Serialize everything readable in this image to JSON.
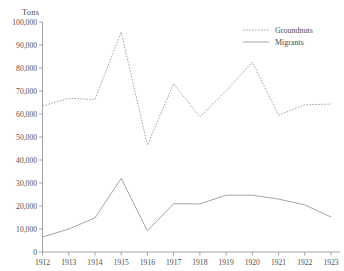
{
  "figure": {
    "cropped_title": "................",
    "y_axis_unit_label": "Tons"
  },
  "legend": {
    "position": "top-right",
    "entries": [
      {
        "label": "Groundnuts",
        "style": "dotted",
        "color": "#9a9a9a"
      },
      {
        "label": "Migrants",
        "style": "solid",
        "color": "#9a9a9a"
      }
    ]
  },
  "chart_data": {
    "type": "line",
    "title": "",
    "xlabel": "",
    "ylabel": "Tons",
    "categories": [
      "1912",
      "1913",
      "1914",
      "1915",
      "1916",
      "1917",
      "1918",
      "1919",
      "1920",
      "1921",
      "1922",
      "1923"
    ],
    "x": [
      1912,
      1913,
      1914,
      1915,
      1916,
      1917,
      1918,
      1919,
      1920,
      1921,
      1922,
      1923
    ],
    "series": [
      {
        "name": "Groundnuts",
        "style": "dotted",
        "color": "#9a9a9a",
        "values": [
          63500,
          66800,
          66300,
          95600,
          46500,
          73200,
          58700,
          70000,
          82600,
          59500,
          64000,
          64300
        ]
      },
      {
        "name": "Migrants",
        "style": "solid",
        "color": "#9a9a9a",
        "values": [
          6500,
          10000,
          14800,
          32000,
          9200,
          21000,
          20900,
          24700,
          24700,
          23000,
          20500,
          15200
        ]
      }
    ],
    "ylim": [
      0,
      100000
    ],
    "ytick_labels": [
      "0",
      "10,000",
      "20,000",
      "30,000",
      "40,000",
      "50,000",
      "60,000",
      "70,000",
      "80,000",
      "90,000",
      "100,000"
    ],
    "ytick_values": [
      0,
      10000,
      20000,
      30000,
      40000,
      50000,
      60000,
      70000,
      80000,
      90000,
      100000
    ],
    "xtick_labels": [
      "1912",
      "1913",
      "1914",
      "1915",
      "1916",
      "1917",
      "1918",
      "1919",
      "1920",
      "1921",
      "1922",
      "1923"
    ],
    "grid": false,
    "legend_position": "top-right"
  }
}
